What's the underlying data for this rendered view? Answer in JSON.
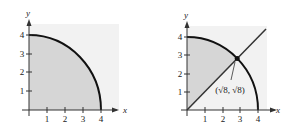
{
  "figures": [
    {
      "id": "quarter-disk",
      "x_axis_label": "x",
      "y_axis_label": "y",
      "x_ticks": [
        "1",
        "2",
        "3",
        "4"
      ],
      "y_ticks": [
        "1",
        "2",
        "3",
        "4"
      ],
      "region": "quarter circle x^2+y^2<=16 in first quadrant",
      "shade_color": "#d9d9d9",
      "curve_color": "#111111"
    },
    {
      "id": "quarter-disk-with-line",
      "x_axis_label": "x",
      "y_axis_label": "y",
      "x_ticks": [
        "1",
        "2",
        "3",
        "4"
      ],
      "y_ticks": [
        "1",
        "2",
        "3",
        "4"
      ],
      "line": "y = x",
      "intersection_label": "(√8, √8)",
      "region": "sector between y-axis and y=x inside circle radius 4",
      "shade_color": "#d9d9d9",
      "background_shade": "#f0f0f0"
    }
  ]
}
